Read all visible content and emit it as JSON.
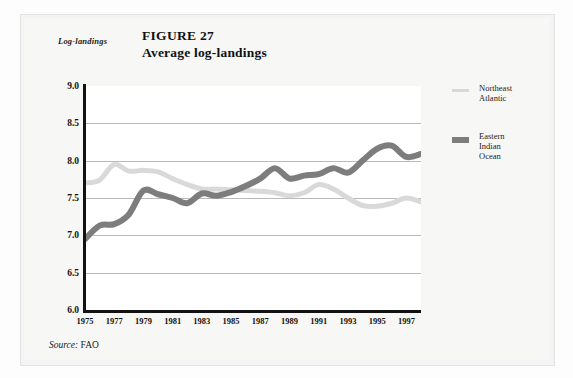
{
  "figure": {
    "label": "FIGURE 27",
    "title": "Average log-landings",
    "y_axis_caption": "Log-landings",
    "source_word": "Source:",
    "source_value": " FAO"
  },
  "legend": {
    "position": "right",
    "entries": [
      {
        "name": "Northeast Atlantic",
        "line1": "Northeast",
        "line2": "Atlantic",
        "line3": "",
        "color": "#d9d9d9",
        "swatch_height": 3
      },
      {
        "name": "Eastern Indian Ocean",
        "line1": "Eastern",
        "line2": "Indian",
        "line3": "Ocean",
        "color": "#7d7d7d",
        "swatch_height": 6
      }
    ]
  },
  "chart_data": {
    "type": "line",
    "title": "Average log-landings",
    "subtitle": "FIGURE 27",
    "xlabel": "",
    "ylabel": "Log-landings",
    "xlim": [
      1975,
      1998
    ],
    "ylim": [
      6.0,
      9.0
    ],
    "ytick_values": [
      9.0,
      8.5,
      8.0,
      7.5,
      7.0,
      6.5,
      6.0
    ],
    "ytick_labels": [
      "9.0",
      "8.5",
      "8.0",
      "7.5",
      "7.0",
      "6.5",
      "6.0"
    ],
    "xtick_values": [
      1975,
      1977,
      1979,
      1981,
      1983,
      1985,
      1987,
      1989,
      1991,
      1993,
      1995,
      1997
    ],
    "xtick_labels": [
      "1975",
      "1977",
      "1979",
      "1981",
      "1983",
      "1985",
      "1987",
      "1989",
      "1991",
      "1993",
      "1995",
      "1997"
    ],
    "grid": "horizontal",
    "gridline_values": [
      8.5,
      8.0,
      7.5,
      7.0,
      6.5
    ],
    "legend_position": "right",
    "x": [
      1975,
      1976,
      1977,
      1978,
      1979,
      1980,
      1981,
      1982,
      1983,
      1984,
      1985,
      1986,
      1987,
      1988,
      1989,
      1990,
      1991,
      1992,
      1993,
      1994,
      1995,
      1996,
      1997,
      1998
    ],
    "series": [
      {
        "name": "Northeast Atlantic",
        "color": "#d9d9d9",
        "width": 5,
        "values": [
          7.7,
          7.74,
          7.95,
          7.86,
          7.87,
          7.85,
          7.76,
          7.68,
          7.62,
          7.62,
          7.61,
          7.6,
          7.59,
          7.57,
          7.53,
          7.57,
          7.68,
          7.62,
          7.5,
          7.4,
          7.39,
          7.43,
          7.5,
          7.45
        ]
      },
      {
        "name": "Eastern Indian Ocean",
        "color": "#7d7d7d",
        "width": 6,
        "values": [
          6.95,
          7.13,
          7.15,
          7.28,
          7.6,
          7.55,
          7.5,
          7.43,
          7.56,
          7.53,
          7.58,
          7.66,
          7.76,
          7.9,
          7.76,
          7.8,
          7.82,
          7.9,
          7.84,
          8.0,
          8.16,
          8.2,
          8.05,
          8.09
        ]
      }
    ]
  }
}
